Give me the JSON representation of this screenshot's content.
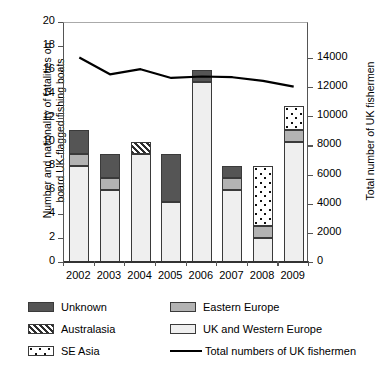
{
  "axes": {
    "left_title": "Number and nationality of fatalities on\nboard UK-flagged fishing boats",
    "right_title": "Total number of UK fishermen",
    "left_ticks": [
      "0",
      "2",
      "4",
      "6",
      "8",
      "10",
      "12",
      "14",
      "16",
      "18",
      "20"
    ],
    "right_ticks": [
      "0",
      "2000",
      "4000",
      "6000",
      "8000",
      "10000",
      "12000",
      "14000"
    ],
    "x_ticks": [
      "2002",
      "2003",
      "2004",
      "2005",
      "2006",
      "2007",
      "2008",
      "2009"
    ]
  },
  "legend": {
    "items": [
      {
        "label": "Unknown",
        "key": "unknown",
        "swatch": "solid-dark-gray"
      },
      {
        "label": "Eastern Europe",
        "key": "eastern_europe",
        "swatch": "solid-mid-gray"
      },
      {
        "label": "Australasia",
        "key": "australasia",
        "swatch": "diagonal-hatch"
      },
      {
        "label": "UK and Western Europe",
        "key": "uk_western_europe",
        "swatch": "solid-white"
      },
      {
        "label": "SE Asia",
        "key": "se_asia",
        "swatch": "dotted"
      },
      {
        "label": "Total numbers of UK fishermen",
        "key": "total_fishermen",
        "swatch": "black-line"
      }
    ]
  },
  "colors": {
    "unknown": "#555555",
    "eastern_europe": "#b3b3b3",
    "uk_western_europe": "#efefef",
    "australasia_hatch": "#2e2e2e",
    "se_asia_dots": "#111111",
    "line": "#000000",
    "axis": "#555555"
  },
  "chart_data": {
    "type": "bar",
    "title": "",
    "xlabel": "",
    "ylabel": "Number and nationality of fatalities on board UK-flagged fishing boats",
    "y2label": "Total number of UK fishermen",
    "categories": [
      "2002",
      "2003",
      "2004",
      "2005",
      "2006",
      "2007",
      "2008",
      "2009"
    ],
    "ylim": [
      0,
      20
    ],
    "ytick_step": 2,
    "y2lim": [
      0,
      16471
    ],
    "y2tick_step": 2000,
    "grid": false,
    "legend_position": "bottom",
    "stacked": true,
    "stack_order": [
      "uk_western_europe",
      "eastern_europe",
      "australasia",
      "se_asia",
      "unknown"
    ],
    "series": [
      {
        "name": "UK and Western Europe",
        "key": "uk_western_europe",
        "values": [
          8,
          6,
          9,
          5,
          15,
          6,
          2,
          10
        ]
      },
      {
        "name": "Eastern Europe",
        "key": "eastern_europe",
        "values": [
          1,
          1,
          0,
          0,
          0,
          1,
          1,
          1
        ]
      },
      {
        "name": "Australasia",
        "key": "australasia",
        "values": [
          0,
          0,
          1,
          0,
          0,
          0,
          0,
          0
        ]
      },
      {
        "name": "SE Asia",
        "key": "se_asia",
        "values": [
          0,
          0,
          0,
          0,
          0,
          0,
          5,
          2
        ]
      },
      {
        "name": "Unknown",
        "key": "unknown",
        "values": [
          2,
          2,
          0,
          4,
          1,
          1,
          0,
          0
        ]
      }
    ],
    "totals": [
      11,
      9,
      10,
      9,
      16,
      8,
      8,
      13
    ],
    "line_series": {
      "name": "Total numbers of UK fishermen",
      "type": "line",
      "axis": "right",
      "values": [
        14100,
        12950,
        13300,
        12700,
        12800,
        12750,
        12500,
        12100
      ]
    }
  }
}
